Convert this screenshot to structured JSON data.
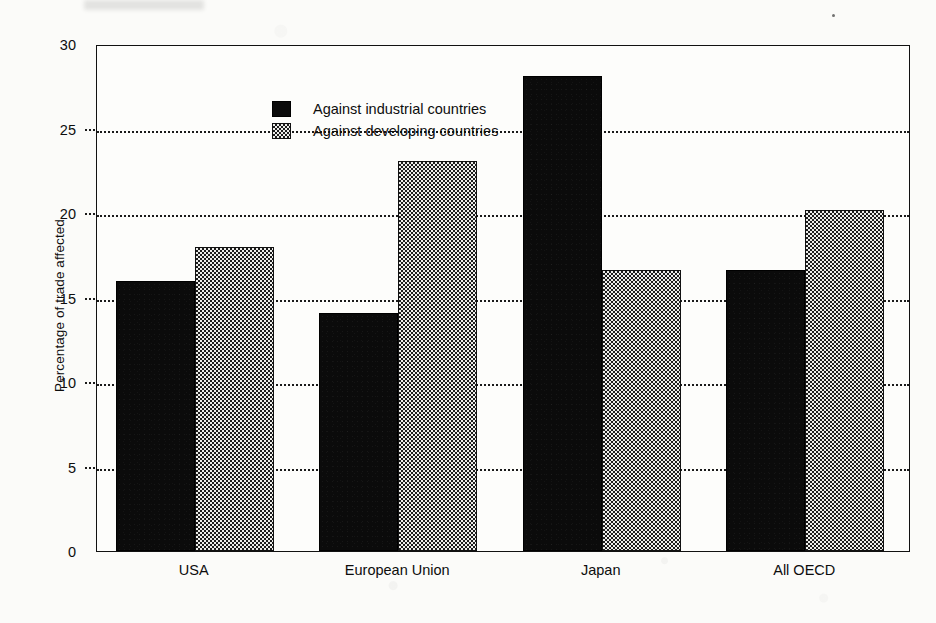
{
  "chart_data": {
    "type": "bar",
    "title": "",
    "subtitle": "",
    "xlabel": "",
    "ylabel": "Percentage of trade affected",
    "categories": [
      "USA",
      "European Union",
      "Japan",
      "All OECD"
    ],
    "series": [
      {
        "name": "Against industrial countries",
        "fill": "solid-black",
        "color": "#0b0b0b",
        "values": [
          16.0,
          14.1,
          28.1,
          16.6
        ]
      },
      {
        "name": "Against developing countries",
        "fill": "checkerboard-gray",
        "color": "#e7e7e5",
        "values": [
          18.0,
          23.1,
          16.6,
          20.2
        ]
      }
    ],
    "ylim": [
      0,
      30
    ],
    "ytick_labels": [
      "0",
      "5",
      "10",
      "15",
      "20",
      "25",
      "30"
    ],
    "ytick_values": [
      0,
      5,
      10,
      15,
      20,
      25,
      30
    ],
    "grid": "horizontal-dotted",
    "legend_position": "top-left-inside",
    "bar_grouping": "grouped"
  },
  "axes": {
    "y_title": "Percentage of trade affected",
    "y_ticks": [
      {
        "label": "30",
        "value": 30
      },
      {
        "label": "25",
        "value": 25
      },
      {
        "label": "20",
        "value": 20
      },
      {
        "label": "15",
        "value": 15
      },
      {
        "label": "10",
        "value": 10
      },
      {
        "label": "5",
        "value": 5
      },
      {
        "label": "0",
        "value": 0
      }
    ],
    "x_ticks": [
      {
        "label": "USA"
      },
      {
        "label": "European Union"
      },
      {
        "label": "Japan"
      },
      {
        "label": "All OECD"
      }
    ]
  },
  "legend": {
    "items": [
      {
        "label": "Against industrial countries",
        "swatch": "solid-black-swatch"
      },
      {
        "label": "Against developing countries",
        "swatch": "checkerboard-swatch"
      }
    ]
  },
  "colors": {
    "series_1": "#0b0b0b",
    "series_2": "#e7e7e5",
    "axis": "#111111",
    "grid": "#1a1a1a",
    "background": "#fbfbf9"
  }
}
